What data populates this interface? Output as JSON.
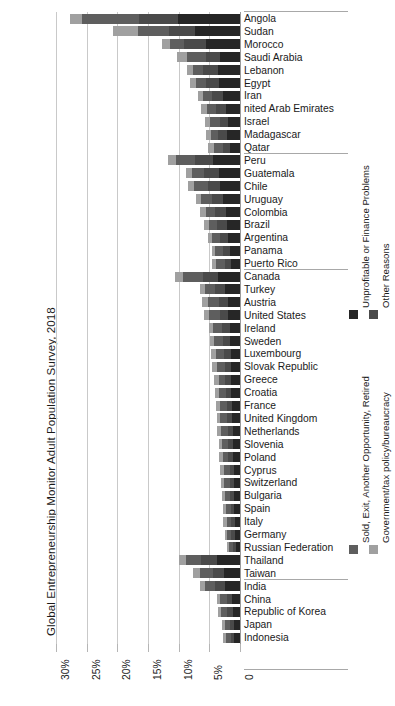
{
  "chart_data": {
    "type": "bar",
    "subtype": "horizontal-stacked",
    "title": "Global Entrepreneurship Monitor Adult Population Survey, 2018",
    "xlabel": "",
    "ylabel": "",
    "xlim": [
      0,
      30
    ],
    "x_axis_reversed": true,
    "grid": true,
    "legend_position": "right",
    "xticks": [
      "30%",
      "25%",
      "20%",
      "15%",
      "10%",
      "5%",
      "0"
    ],
    "xtick_values": [
      30,
      25,
      20,
      15,
      10,
      5,
      0
    ],
    "series": [
      {
        "name": "Unprofitable or Finance Problems",
        "color": "#262626"
      },
      {
        "name": "Other Reasons",
        "color": "#4a4a4a"
      },
      {
        "name": "Sold, Exit, Another Opportunity, Retired",
        "color": "#5e5e5e"
      },
      {
        "name": "Government/tax policy/bureaucracy",
        "color": "#a0a0a0"
      }
    ],
    "region_groups": [
      {
        "name": "Africa & Middle East",
        "count": 11
      },
      {
        "name": "Latin America & Caribbean",
        "count": 9
      },
      {
        "name": "Europe & North America",
        "count": 24
      },
      {
        "name": "Asia & Pacific",
        "count": 7
      }
    ],
    "categories": [
      "Angola",
      "Sudan",
      "Morocco",
      "Saudi Arabia",
      "Lebanon",
      "Egypt",
      "Iran",
      "nited Arab Emirates",
      "Israel",
      "Madagascar",
      "Qatar",
      "Peru",
      "Guatemala",
      "Chile",
      "Uruguay",
      "Colombia",
      "Brazil",
      "Argentina",
      "Panama",
      "Puerto Rico",
      "Canada",
      "Turkey",
      "Austria",
      "United States",
      "Ireland",
      "Sweden",
      "Luxembourg",
      "Slovak Republic",
      "Greece",
      "Croatia",
      "France",
      "United Kingdom",
      "Netherlands",
      "Slovenia",
      "Poland",
      "Cyprus",
      "Switzerland",
      "Bulgaria",
      "Spain",
      "Italy",
      "Germany",
      "Russian Federation",
      "Thailand",
      "Taiwan",
      "India",
      "China",
      "Republic of Korea",
      "Japan",
      "Indonesia"
    ],
    "values": [
      {
        "country": "Angola",
        "unprofitable": 10.1,
        "other": 6.4,
        "sold_exit": 9.2,
        "government": 2.0,
        "total": 27.7
      },
      {
        "country": "Sudan",
        "unprofitable": 7.3,
        "other": 4.2,
        "sold_exit": 5.1,
        "government": 4.1,
        "total": 20.7
      },
      {
        "country": "Morocco",
        "unprofitable": 5.5,
        "other": 3.6,
        "sold_exit": 2.3,
        "government": 1.3,
        "total": 12.7
      },
      {
        "country": "Saudi Arabia",
        "unprofitable": 3.2,
        "other": 2.4,
        "sold_exit": 3.0,
        "government": 1.6,
        "total": 10.2
      },
      {
        "country": "Lebanon",
        "unprofitable": 3.6,
        "other": 2.4,
        "sold_exit": 1.6,
        "government": 1.0,
        "total": 8.6
      },
      {
        "country": "Egypt",
        "unprofitable": 3.4,
        "other": 2.1,
        "sold_exit": 1.7,
        "government": 1.0,
        "total": 8.2
      },
      {
        "country": "Iran",
        "unprofitable": 2.8,
        "other": 1.8,
        "sold_exit": 1.4,
        "government": 0.8,
        "total": 6.8
      },
      {
        "country": "nited Arab Emirates",
        "unprofitable": 2.3,
        "other": 1.6,
        "sold_exit": 1.5,
        "government": 0.9,
        "total": 6.3
      },
      {
        "country": "Israel",
        "unprofitable": 1.9,
        "other": 1.4,
        "sold_exit": 1.6,
        "government": 0.8,
        "total": 5.7
      },
      {
        "country": "Madagascar",
        "unprofitable": 2.1,
        "other": 1.5,
        "sold_exit": 1.2,
        "government": 0.7,
        "total": 5.5
      },
      {
        "country": "Qatar",
        "unprofitable": 1.6,
        "other": 1.2,
        "sold_exit": 1.5,
        "government": 0.9,
        "total": 5.2
      },
      {
        "country": "Peru",
        "unprofitable": 4.4,
        "other": 3.0,
        "sold_exit": 3.0,
        "government": 1.3,
        "total": 11.7
      },
      {
        "country": "Guatemala",
        "unprofitable": 3.5,
        "other": 2.3,
        "sold_exit": 2.0,
        "government": 1.0,
        "total": 8.8
      },
      {
        "country": "Chile",
        "unprofitable": 3.2,
        "other": 2.1,
        "sold_exit": 2.2,
        "government": 1.0,
        "total": 8.5
      },
      {
        "country": "Uruguay",
        "unprofitable": 2.7,
        "other": 1.8,
        "sold_exit": 1.8,
        "government": 0.9,
        "total": 7.2
      },
      {
        "country": "Colombia",
        "unprofitable": 2.3,
        "other": 1.7,
        "sold_exit": 1.6,
        "government": 0.9,
        "total": 6.5
      },
      {
        "country": "Brazil",
        "unprofitable": 2.2,
        "other": 1.5,
        "sold_exit": 1.4,
        "government": 0.7,
        "total": 5.8
      },
      {
        "country": "Argentina",
        "unprofitable": 1.9,
        "other": 1.3,
        "sold_exit": 1.3,
        "government": 0.7,
        "total": 5.2
      },
      {
        "country": "Panama",
        "unprofitable": 1.6,
        "other": 1.2,
        "sold_exit": 1.2,
        "government": 0.6,
        "total": 4.6
      },
      {
        "country": "Puerto Rico",
        "unprofitable": 1.5,
        "other": 1.0,
        "sold_exit": 1.4,
        "government": 0.6,
        "total": 4.5
      },
      {
        "country": "Canada",
        "unprofitable": 3.6,
        "other": 2.5,
        "sold_exit": 3.2,
        "government": 1.3,
        "total": 10.6
      },
      {
        "country": "Turkey",
        "unprofitable": 2.4,
        "other": 1.7,
        "sold_exit": 1.6,
        "government": 0.9,
        "total": 6.6
      },
      {
        "country": "Austria",
        "unprofitable": 2.0,
        "other": 1.4,
        "sold_exit": 1.9,
        "government": 0.9,
        "total": 6.2
      },
      {
        "country": "United States",
        "unprofitable": 1.9,
        "other": 1.4,
        "sold_exit": 1.8,
        "government": 0.8,
        "total": 5.9
      },
      {
        "country": "Ireland",
        "unprofitable": 1.7,
        "other": 1.2,
        "sold_exit": 1.5,
        "government": 0.7,
        "total": 5.1
      },
      {
        "country": "Sweden",
        "unprofitable": 1.6,
        "other": 1.2,
        "sold_exit": 1.4,
        "government": 0.7,
        "total": 4.9
      },
      {
        "country": "Luxembourg",
        "unprofitable": 1.5,
        "other": 1.1,
        "sold_exit": 1.4,
        "government": 0.7,
        "total": 4.7
      },
      {
        "country": "Slovak Republic",
        "unprofitable": 1.5,
        "other": 1.0,
        "sold_exit": 1.2,
        "government": 0.8,
        "total": 4.5
      },
      {
        "country": "Greece",
        "unprofitable": 1.4,
        "other": 1.0,
        "sold_exit": 1.1,
        "government": 0.8,
        "total": 4.3
      },
      {
        "country": "Croatia",
        "unprofitable": 1.4,
        "other": 0.9,
        "sold_exit": 1.1,
        "government": 0.7,
        "total": 4.1
      },
      {
        "country": "France",
        "unprofitable": 1.3,
        "other": 0.9,
        "sold_exit": 1.1,
        "government": 0.6,
        "total": 3.9
      },
      {
        "country": "United Kingdom",
        "unprofitable": 1.3,
        "other": 0.9,
        "sold_exit": 1.0,
        "government": 0.6,
        "total": 3.8
      },
      {
        "country": "Netherlands",
        "unprofitable": 1.2,
        "other": 0.8,
        "sold_exit": 1.1,
        "government": 0.6,
        "total": 3.7
      },
      {
        "country": "Slovenia",
        "unprofitable": 1.1,
        "other": 0.8,
        "sold_exit": 1.0,
        "government": 0.6,
        "total": 3.5
      },
      {
        "country": "Poland",
        "unprofitable": 1.1,
        "other": 0.8,
        "sold_exit": 0.9,
        "government": 0.6,
        "total": 3.4
      },
      {
        "country": "Cyprus",
        "unprofitable": 1.0,
        "other": 0.7,
        "sold_exit": 0.9,
        "government": 0.7,
        "total": 3.3
      },
      {
        "country": "Switzerland",
        "unprofitable": 1.0,
        "other": 0.7,
        "sold_exit": 0.9,
        "government": 0.5,
        "total": 3.1
      },
      {
        "country": "Bulgaria",
        "unprofitable": 1.0,
        "other": 0.7,
        "sold_exit": 0.8,
        "government": 0.5,
        "total": 3.0
      },
      {
        "country": "Spain",
        "unprofitable": 0.9,
        "other": 0.6,
        "sold_exit": 0.8,
        "government": 0.5,
        "total": 2.8
      },
      {
        "country": "Italy",
        "unprofitable": 0.8,
        "other": 0.6,
        "sold_exit": 0.8,
        "government": 0.5,
        "total": 2.7
      },
      {
        "country": "Germany",
        "unprofitable": 0.8,
        "other": 0.6,
        "sold_exit": 0.7,
        "government": 0.4,
        "total": 2.5
      },
      {
        "country": "Russian Federation",
        "unprofitable": 0.7,
        "other": 0.5,
        "sold_exit": 0.6,
        "government": 0.4,
        "total": 2.2
      },
      {
        "country": "Thailand",
        "unprofitable": 3.8,
        "other": 2.6,
        "sold_exit": 2.4,
        "government": 1.2,
        "total": 10.0
      },
      {
        "country": "Taiwan",
        "unprofitable": 2.6,
        "other": 1.8,
        "sold_exit": 2.2,
        "government": 1.0,
        "total": 7.6
      },
      {
        "country": "India",
        "unprofitable": 2.4,
        "other": 1.7,
        "sold_exit": 1.6,
        "government": 0.9,
        "total": 6.6
      },
      {
        "country": "China",
        "unprofitable": 1.3,
        "other": 0.9,
        "sold_exit": 1.0,
        "government": 0.6,
        "total": 3.8
      },
      {
        "country": "Republic of Korea",
        "unprofitable": 1.2,
        "other": 0.9,
        "sold_exit": 1.0,
        "government": 0.5,
        "total": 3.6
      },
      {
        "country": "Japan",
        "unprofitable": 1.0,
        "other": 0.7,
        "sold_exit": 0.8,
        "government": 0.5,
        "total": 3.0
      },
      {
        "country": "Indonesia",
        "unprofitable": 0.9,
        "other": 0.6,
        "sold_exit": 0.8,
        "government": 0.5,
        "total": 2.8
      }
    ]
  }
}
